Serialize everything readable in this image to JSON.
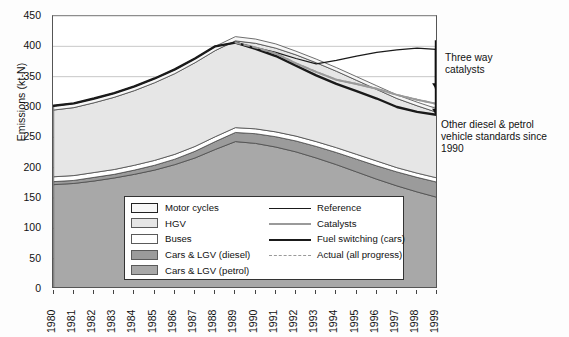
{
  "axes": {
    "ylabel": "Emissions (kt-N)",
    "yticks": [
      0,
      50,
      100,
      150,
      200,
      250,
      300,
      350,
      400,
      450
    ],
    "xticks": [
      "1980",
      "1981",
      "1982",
      "1983",
      "1984",
      "1985",
      "1986",
      "1987",
      "1988",
      "1989",
      "1990",
      "1991",
      "1992",
      "1993",
      "1994",
      "1995",
      "1996",
      "1997",
      "1998",
      "1999"
    ]
  },
  "legend": {
    "areas": [
      {
        "label": "Motor cycles",
        "color": "#f7f7f7"
      },
      {
        "label": "HGV",
        "color": "#e6e6e6"
      },
      {
        "label": "Buses",
        "color": "#ffffff"
      },
      {
        "label": "Cars & LGV (diesel)",
        "color": "#9b9b9b"
      },
      {
        "label": "Cars & LGV (petrol)",
        "color": "#a8a8a8"
      }
    ],
    "lines": [
      {
        "label": "Reference",
        "color": "#1a1a1a",
        "width": 1.2,
        "dash": "none"
      },
      {
        "label": "Catalysts",
        "color": "#9a9a9a",
        "width": 2.0,
        "dash": "none"
      },
      {
        "label": "Fuel switching (cars)",
        "color": "#1a1a1a",
        "width": 2.4,
        "dash": "none"
      },
      {
        "label": "Actual (all progress)",
        "color": "#9a9a9a",
        "width": 1.8,
        "dash": "dashed"
      }
    ]
  },
  "annotations": [
    {
      "text": "Three way\ncatalysts"
    },
    {
      "text": "Other diesel & petrol\nvehicle standards since\n1990"
    }
  ],
  "chart_data": {
    "type": "area",
    "title": "",
    "xlabel": "",
    "ylabel": "Emissions (kt-N)",
    "ylim": [
      0,
      450
    ],
    "grid": true,
    "legend_position": "inside-bottom-left",
    "x": [
      1980,
      1981,
      1982,
      1983,
      1984,
      1985,
      1986,
      1987,
      1988,
      1989,
      1990,
      1991,
      1992,
      1993,
      1994,
      1995,
      1996,
      1997,
      1998,
      1999
    ],
    "stack_order": [
      "Cars & LGV (petrol)",
      "Cars & LGV (diesel)",
      "Buses",
      "HGV",
      "Motor cycles"
    ],
    "series": [
      {
        "name": "Cars & LGV (petrol)",
        "values": [
          172,
          174,
          178,
          183,
          189,
          196,
          205,
          216,
          230,
          243,
          240,
          234,
          226,
          216,
          205,
          193,
          181,
          170,
          160,
          151
        ]
      },
      {
        "name": "Cars & LGV (diesel)",
        "values": [
          5,
          5,
          6,
          6,
          7,
          8,
          9,
          11,
          13,
          15,
          16,
          17,
          18,
          19,
          20,
          21,
          22,
          23,
          24,
          25
        ]
      },
      {
        "name": "Buses",
        "values": [
          8,
          8,
          8,
          8,
          8,
          8,
          8,
          8,
          8,
          8,
          8,
          8,
          8,
          8,
          8,
          8,
          8,
          7,
          7,
          7
        ]
      },
      {
        "name": "HGV",
        "values": [
          110,
          112,
          115,
          119,
          123,
          128,
          133,
          138,
          142,
          143,
          141,
          138,
          134,
          130,
          126,
          122,
          118,
          114,
          111,
          108
        ]
      },
      {
        "name": "Motor cycles",
        "values": [
          7,
          7,
          7,
          7,
          7,
          7,
          7,
          7,
          7,
          7,
          7,
          7,
          6,
          6,
          6,
          6,
          6,
          6,
          6,
          6
        ]
      }
    ],
    "stack_totals": [
      302,
      306,
      314,
      323,
      334,
      347,
      362,
      380,
      400,
      406,
      402,
      394,
      382,
      369,
      355,
      340,
      325,
      310,
      298,
      287
    ],
    "lines": [
      {
        "name": "Reference",
        "values": [
          302,
          306,
          314,
          323,
          334,
          347,
          362,
          380,
          400,
          406,
          398,
          390,
          380,
          371,
          377,
          384,
          390,
          394,
          397,
          395
        ]
      },
      {
        "name": "Catalysts",
        "values": [
          null,
          null,
          null,
          null,
          null,
          null,
          null,
          null,
          null,
          406,
          398,
          388,
          372,
          358,
          345,
          338,
          330,
          320,
          312,
          305
        ]
      },
      {
        "name": "Fuel switching (cars)",
        "values": [
          302,
          306,
          314,
          323,
          334,
          347,
          362,
          380,
          400,
          406,
          396,
          384,
          368,
          352,
          338,
          326,
          314,
          300,
          292,
          287
        ]
      },
      {
        "name": "Actual (all progress)",
        "values": [
          null,
          null,
          null,
          null,
          null,
          null,
          null,
          null,
          null,
          406,
          398,
          388,
          372,
          358,
          345,
          338,
          330,
          320,
          312,
          305
        ]
      }
    ],
    "annotations": [
      {
        "text": "Three way catalysts",
        "points_to_y": 330,
        "points_to_x": 1999
      },
      {
        "text": "Other diesel & petrol vehicle standards since 1990",
        "points_to_y": 288,
        "points_to_x": 1999
      }
    ]
  }
}
